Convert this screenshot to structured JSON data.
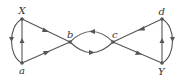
{
  "diagram": {
    "type": "directed-graph",
    "nodes": [
      {
        "id": "X",
        "label": "X",
        "x": 22,
        "y": 19
      },
      {
        "id": "a",
        "label": "a",
        "x": 22,
        "y": 63
      },
      {
        "id": "b",
        "label": "b",
        "x": 70,
        "y": 42
      },
      {
        "id": "c",
        "label": "c",
        "x": 113,
        "y": 42
      },
      {
        "id": "d",
        "label": "d",
        "x": 162,
        "y": 19
      },
      {
        "id": "Y",
        "label": "Y",
        "x": 162,
        "y": 63
      }
    ],
    "edges": [
      {
        "from": "a",
        "to": "X",
        "shape": "straight"
      },
      {
        "from": "X",
        "to": "a",
        "shape": "curved-left"
      },
      {
        "from": "X",
        "to": "b",
        "shape": "straight"
      },
      {
        "from": "a",
        "to": "b",
        "shape": "straight"
      },
      {
        "from": "c",
        "to": "b",
        "shape": "curved-upper"
      },
      {
        "from": "b",
        "to": "c",
        "shape": "curved-lower"
      },
      {
        "from": "c",
        "to": "d",
        "shape": "straight"
      },
      {
        "from": "c",
        "to": "Y",
        "shape": "straight"
      },
      {
        "from": "Y",
        "to": "d",
        "shape": "straight"
      },
      {
        "from": "d",
        "to": "Y",
        "shape": "curved-right"
      }
    ]
  }
}
